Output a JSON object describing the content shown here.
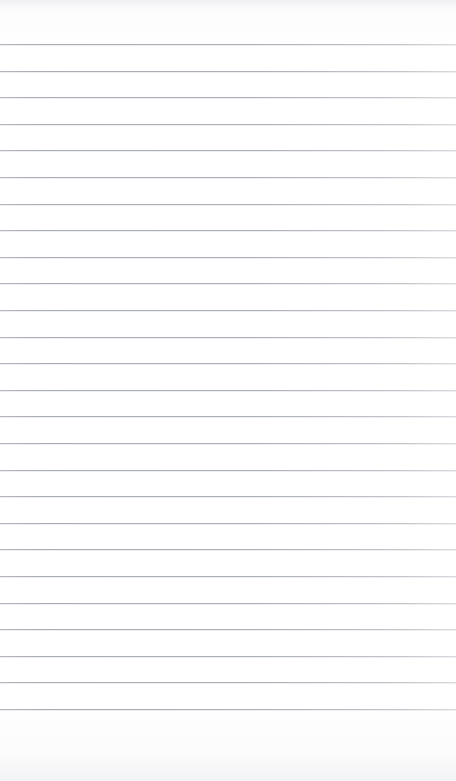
{
  "document": {
    "kind": "ruled-paper",
    "title": "Blank Ruled Notebook Page",
    "content_text": "",
    "has_written_content": false,
    "page_width": 456,
    "page_height": 781
  },
  "paper": {
    "background_color": "#fefefe",
    "surface_tone_color": "#fbfbfc",
    "edge_shadow_color": "#d0d2d6"
  },
  "ruling": {
    "line_color": "#acb0b7",
    "line_thickness": 1,
    "line_spacing": 26.6,
    "first_line_y": 44,
    "line_count": 26,
    "left_inset": 0,
    "right_inset": 0,
    "margin_rule": false,
    "top_margin": 44,
    "bottom_margin": 58,
    "line_y_positions": [
      44,
      70.6,
      97.2,
      123.8,
      150.4,
      177,
      203.6,
      230.2,
      256.8,
      283.4,
      310,
      336.6,
      363.2,
      389.8,
      416.4,
      443,
      469.6,
      496.2,
      522.8,
      549.4,
      576,
      602.6,
      629.2,
      655.8,
      682.4,
      709
    ]
  }
}
